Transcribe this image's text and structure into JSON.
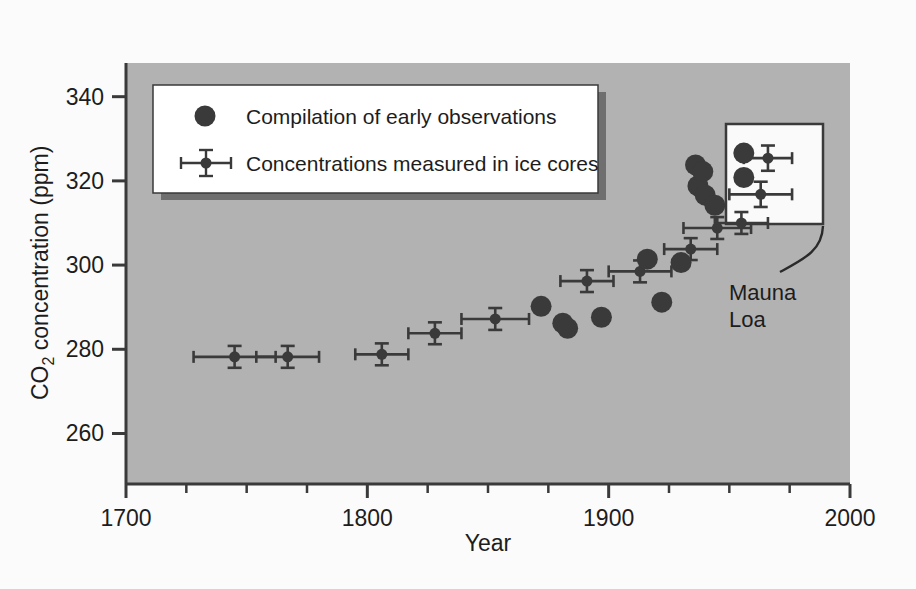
{
  "figure": {
    "background_color": "#fbfbfb",
    "plot_background_color": "#b2b2b2",
    "axis_color": "#3a3a3a",
    "marker_color": "#3a3a3a",
    "legend_background_color": "#ffffff",
    "legend_border_color": "#3a3a3a",
    "legend_shadow_color": "#6f6f6f",
    "inset_background_color": "#fafafa"
  },
  "axes": {
    "x_title": "Year",
    "y_title_main": "CO",
    "y_title_sub": "2",
    "y_title_rest": " concentration (ppm)",
    "x_tick_labels": [
      "1700",
      "1800",
      "1900",
      "2000"
    ],
    "y_tick_labels": [
      "260",
      "280",
      "300",
      "320",
      "340"
    ]
  },
  "legend": {
    "items": [
      {
        "label": "Compilation of early observations",
        "marker": "filled-circle"
      },
      {
        "label": "Concentrations measured in ice cores",
        "marker": "point-with-error-bars"
      }
    ]
  },
  "annotations": [
    {
      "name": "mauna-loa",
      "line1": "Mauna",
      "line2": "Loa"
    }
  ],
  "chart_data": {
    "type": "scatter",
    "title": "",
    "xlabel": "Year",
    "ylabel": "CO2 concentration (ppm)",
    "xlim": [
      1700,
      2000
    ],
    "ylim": [
      248,
      348
    ],
    "grid": false,
    "legend_position": "top-left",
    "x_ticks_major": [
      1700,
      1800,
      1900,
      2000
    ],
    "x_ticks_minor_step": 25,
    "y_ticks": [
      260,
      280,
      300,
      320,
      340
    ],
    "series": [
      {
        "name": "Concentrations measured in ice cores",
        "marker": "point-with-error-bars",
        "points": [
          {
            "x": 1745,
            "y": 278.2,
            "xerr": 17,
            "yerr": 2.6
          },
          {
            "x": 1767,
            "y": 278.2,
            "xerr": 13,
            "yerr": 2.6
          },
          {
            "x": 1806,
            "y": 278.8,
            "xerr": 11,
            "yerr": 2.6
          },
          {
            "x": 1828,
            "y": 283.8,
            "xerr": 11,
            "yerr": 2.6
          },
          {
            "x": 1853,
            "y": 287.2,
            "xerr": 14,
            "yerr": 2.6
          },
          {
            "x": 1891,
            "y": 296.2,
            "xerr": 11,
            "yerr": 2.6
          },
          {
            "x": 1913,
            "y": 298.5,
            "xerr": 13,
            "yerr": 2.6
          },
          {
            "x": 1934,
            "y": 303.8,
            "xerr": 11,
            "yerr": 2.6
          },
          {
            "x": 1945,
            "y": 308.8,
            "xerr": 14,
            "yerr": 2.6
          },
          {
            "x": 1955,
            "y": 310.0,
            "xerr": 11,
            "yerr": 2.6
          },
          {
            "x": 1966,
            "y": 325.4,
            "xerr": 10,
            "yerr": 3.0
          },
          {
            "x": 1963,
            "y": 316.8,
            "xerr": 13,
            "yerr": 3.0
          }
        ]
      },
      {
        "name": "Compilation of early observations",
        "marker": "filled-circle",
        "points": [
          {
            "x": 1872,
            "y": 290.2
          },
          {
            "x": 1881,
            "y": 286.2
          },
          {
            "x": 1883,
            "y": 285.0
          },
          {
            "x": 1897,
            "y": 287.6
          },
          {
            "x": 1916,
            "y": 301.4
          },
          {
            "x": 1922,
            "y": 291.2
          },
          {
            "x": 1930,
            "y": 300.6
          },
          {
            "x": 1936,
            "y": 323.8
          },
          {
            "x": 1937,
            "y": 318.8
          },
          {
            "x": 1939,
            "y": 322.2
          },
          {
            "x": 1940,
            "y": 316.6
          },
          {
            "x": 1944,
            "y": 314.2
          },
          {
            "x": 1956,
            "y": 326.6
          },
          {
            "x": 1956,
            "y": 320.8
          }
        ]
      }
    ]
  }
}
